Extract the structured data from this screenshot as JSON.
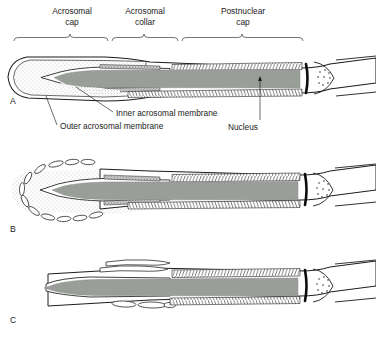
{
  "figure": {
    "background_color": "#ffffff",
    "ink_color": "#1a1a1a",
    "nucleus_fill": "#9a9e98",
    "acrosome_stipple_color": "#8d8d8d",
    "width": 376,
    "height": 339
  },
  "region_labels": [
    {
      "id": "acrosomal-cap",
      "line1": "Acrosomal",
      "line2": "cap",
      "text_center_x": 72,
      "line1_y": 14,
      "line2_y": 25,
      "bracket": {
        "x_start": 14,
        "x_end": 108,
        "y": 38
      }
    },
    {
      "id": "acrosomal-collar",
      "line1": "Acrosomal",
      "line2": "collar",
      "text_center_x": 145,
      "line1_y": 14,
      "line2_y": 25,
      "bracket": {
        "x_start": 112,
        "x_end": 178,
        "y": 38
      }
    },
    {
      "id": "postnuclear-cap",
      "line1": "Postnuclear",
      "line2": "cap",
      "text_center_x": 243,
      "line1_y": 14,
      "line2_y": 25,
      "bracket": {
        "x_start": 182,
        "x_end": 303,
        "y": 38
      }
    }
  ],
  "callouts": [
    {
      "id": "inner-acrosomal-membrane",
      "text": "Inner acrosomal membrane",
      "text_x": 117,
      "text_y": 116,
      "leader": {
        "x1": 113,
        "y1": 113,
        "x2": 75,
        "y2": 88
      }
    },
    {
      "id": "outer-acrosomal-membrane",
      "text": "Outer acrosomal membrane",
      "text_x": 60,
      "text_y": 130,
      "leader": {
        "x1": 56,
        "y1": 126,
        "x2": 46,
        "y2": 96
      }
    },
    {
      "id": "nucleus",
      "text": "Nucleus",
      "text_x": 243,
      "text_y": 130,
      "leader": {
        "x1": 260,
        "y1": 120,
        "x2": 260,
        "y2": 78
      }
    }
  ],
  "panels": [
    {
      "id": "panel-a",
      "letter": "A",
      "letter_x": 10,
      "letter_y": 104,
      "caption_state": "intact acrosome before the acrosome reaction"
    },
    {
      "id": "panel-b",
      "letter": "B",
      "letter_x": 10,
      "letter_y": 232,
      "caption_state": "vesiculation of plasma and outer acrosomal membranes"
    },
    {
      "id": "panel-c",
      "letter": "C",
      "letter_x": 10,
      "letter_y": 323,
      "caption_state": "acrosomal contents released, inner acrosomal membrane exposed"
    }
  ],
  "structures": {
    "nucleus": "nucleus",
    "postnuclear_cap_hatching": "postnuclear-cap-hatching",
    "acrosomal_matrix": "acrosomal-matrix-stipple",
    "implantation_fossa_bar": "implantation-fossa-bar",
    "centriole_capitulum": "centriole-capitulum",
    "neck": "sperm-neck",
    "plasma_membrane": "plasma-membrane",
    "vesicles": "membrane-vesicles"
  }
}
